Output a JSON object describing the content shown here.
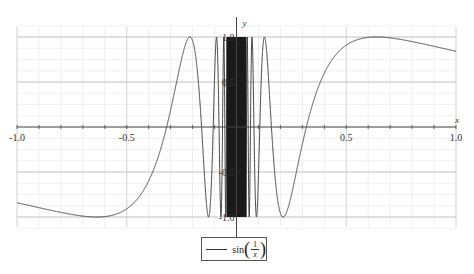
{
  "chart_data": {
    "type": "line",
    "title": "",
    "function": "sin(1/x)",
    "xlabel": "x",
    "ylabel": "y",
    "xlim": [
      -1.0,
      1.0
    ],
    "ylim": [
      -1.0,
      1.0
    ],
    "x_ticks": [
      "-1.0",
      "-0.5",
      "0.5",
      "1.0"
    ],
    "y_ticks": [
      "1.0",
      "0.5",
      "-0.5",
      "-1.0"
    ],
    "grid": true,
    "series": [
      {
        "name": "sin(1/x)",
        "color": "#333333",
        "sample_points": [
          [
            -1.0,
            -0.841
          ],
          [
            -0.8,
            -0.949
          ],
          [
            -0.637,
            -1.0
          ],
          [
            -0.5,
            -0.909
          ],
          [
            -0.318,
            0.0
          ],
          [
            -0.212,
            1.0
          ],
          [
            -0.159,
            0.0
          ],
          [
            0.159,
            0.0
          ],
          [
            0.212,
            -1.0
          ],
          [
            0.318,
            0.0
          ],
          [
            0.5,
            0.909
          ],
          [
            0.637,
            1.0
          ],
          [
            0.8,
            0.949
          ],
          [
            1.0,
            0.841
          ]
        ]
      }
    ],
    "legend": {
      "position": "bottom",
      "entries": [
        "sin(1/x)"
      ]
    }
  },
  "legend": {
    "func": "sin",
    "num": "1",
    "den": "x"
  },
  "colors": {
    "curve": "#333333",
    "grid": "#d8d8d8",
    "axis": "#444444"
  }
}
